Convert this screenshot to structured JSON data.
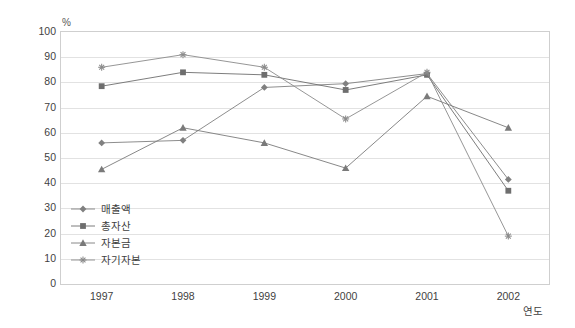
{
  "chart_data": {
    "type": "line",
    "title": "",
    "xlabel": "연도",
    "ylabel": "",
    "unit_label": "%",
    "categories": [
      "1997",
      "1998",
      "1999",
      "2000",
      "2001",
      "2002"
    ],
    "ylim": [
      0,
      100
    ],
    "yticks": [
      100,
      90,
      80,
      70,
      60,
      50,
      40,
      30,
      20,
      10,
      0
    ],
    "grid": true,
    "legend_position": "inside-bottom-left",
    "series": [
      {
        "name": "매출액",
        "marker": "diamond",
        "color": "#808080",
        "values": [
          56,
          57,
          78,
          79.5,
          83.5,
          41.5
        ]
      },
      {
        "name": "총자산",
        "marker": "square",
        "color": "#6e6e6e",
        "values": [
          78.5,
          84,
          83,
          77,
          83,
          37
        ]
      },
      {
        "name": "자본금",
        "marker": "triangle",
        "color": "#7a7a7a",
        "values": [
          45.5,
          62,
          56,
          46,
          74.5,
          62
        ]
      },
      {
        "name": "자기자본",
        "marker": "asterisk",
        "color": "#8a8a8a",
        "values": [
          86,
          91,
          86,
          65.5,
          84,
          19
        ]
      }
    ]
  },
  "axis": {
    "y_ticks": [
      "100",
      "90",
      "80",
      "70",
      "60",
      "50",
      "40",
      "30",
      "20",
      "10",
      "0"
    ],
    "x_ticks": [
      "1997",
      "1998",
      "1999",
      "2000",
      "2001",
      "2002"
    ],
    "x_title": "연도",
    "unit": "%"
  },
  "legend": {
    "items": [
      {
        "label": "매출액"
      },
      {
        "label": "총자산"
      },
      {
        "label": "자본금"
      },
      {
        "label": "자기자본"
      }
    ]
  }
}
